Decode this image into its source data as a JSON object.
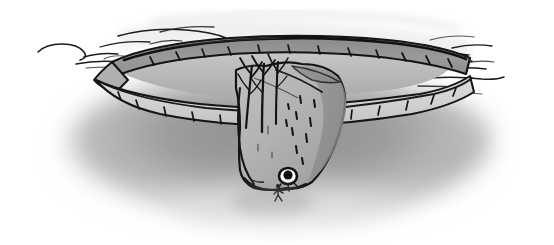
{
  "artwork": {
    "title": "Cave Opening Seen From Below",
    "medium": "pen-and-ink with grey wash",
    "palette": {
      "paper": "#ffffff",
      "ink": "#141414",
      "ink_soft": "#2a2a2a",
      "wash_dark": "#8c8c8c",
      "wash_mid": "#a8a8a8",
      "wash_light": "#cfcfcf",
      "wash_pale": "#e6e6e6",
      "void_shadow": "#9a9a9a",
      "rock_face": "#b4b4b4",
      "rock_face_shaded": "#9c9c9c"
    },
    "canvas": {
      "width": 554,
      "height": 245
    }
  },
  "scene": {
    "description": "A rocky ledge rim arcs across the upper third of the frame. Below it a great slab of rock hangs downward into a softly shaded void, with bare trees rising at its left shoulder and a tiny figure standing beside a dark opening near the bottom tip.",
    "elements": [
      {
        "name": "mist-left",
        "label": "Wispy mist lines at left",
        "note": "Thin curling strokes drifting off the left edge of the rim"
      },
      {
        "name": "mist-right",
        "label": "Wispy mist lines at right",
        "note": "Angular zig-zag strokes trailing off the right edge of the rim"
      },
      {
        "name": "ledge-upper-band",
        "label": "Upper rim band",
        "note": "Darker grey slab forming the far lip of the opening, hatched with short tick marks"
      },
      {
        "name": "ledge-lower-band",
        "label": "Lower rim band",
        "note": "Paler grey slab forming the near lip of the opening, hatched with short tick marks"
      },
      {
        "name": "hanging-rock",
        "label": "Hanging rock column",
        "note": "Tapering mass of stone descending from the rim toward the centre-bottom"
      },
      {
        "name": "bare-trees",
        "label": "Bare trees",
        "note": "Three slender leafless trunks with forked branches growing at the rock's shoulder"
      },
      {
        "name": "cave-mouth",
        "label": "Small dark opening",
        "note": "A small black oval near the lower right of the hanging rock"
      },
      {
        "name": "tiny-figure",
        "label": "Tiny stick figure",
        "note": "A minute human figure standing just below and left of the dark opening, giving scale"
      },
      {
        "name": "void-shadow",
        "label": "Shaded void",
        "note": "Broad soft grey arc of shadow fading outward beneath the formation"
      }
    ]
  }
}
